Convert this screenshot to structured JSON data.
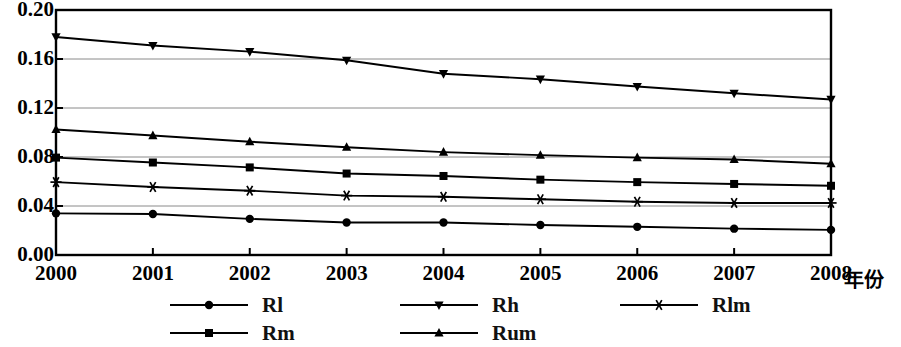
{
  "chart_data": {
    "type": "line",
    "title": "",
    "xlabel": "年份",
    "ylabel": "",
    "x": [
      2000,
      2001,
      2002,
      2003,
      2004,
      2005,
      2006,
      2007,
      2008
    ],
    "categories": [
      "2000",
      "2001",
      "2002",
      "2003",
      "2004",
      "2005",
      "2006",
      "2007",
      "2008"
    ],
    "ylim": [
      0.0,
      0.2
    ],
    "yticks": [
      0.0,
      0.04,
      0.08,
      0.12,
      0.16,
      0.2
    ],
    "ytick_labels": [
      "0.00",
      "0.04",
      "0.08",
      "0.12",
      "0.16",
      "0.20"
    ],
    "grid": "horizontal",
    "legend_position": "below",
    "series": [
      {
        "name": "Rl",
        "marker": "circle",
        "color": "#000000",
        "values": [
          0.034,
          0.0335,
          0.0295,
          0.0265,
          0.0265,
          0.0245,
          0.023,
          0.0215,
          0.0205
        ]
      },
      {
        "name": "Rh",
        "marker": "triangle-down",
        "color": "#000000",
        "values": [
          0.178,
          0.171,
          0.166,
          0.159,
          0.148,
          0.1435,
          0.1375,
          0.132,
          0.127
        ]
      },
      {
        "name": "Rlm",
        "marker": "asterisk",
        "color": "#000000",
        "values": [
          0.0595,
          0.0555,
          0.0525,
          0.0485,
          0.0475,
          0.0455,
          0.0435,
          0.0425,
          0.0425
        ]
      },
      {
        "name": "Rm",
        "marker": "square",
        "color": "#000000",
        "values": [
          0.0795,
          0.0755,
          0.0715,
          0.0665,
          0.0645,
          0.0615,
          0.0595,
          0.058,
          0.0565
        ]
      },
      {
        "name": "Rum",
        "marker": "triangle-up",
        "color": "#000000",
        "values": [
          0.1025,
          0.0975,
          0.0925,
          0.088,
          0.084,
          0.0815,
          0.0795,
          0.078,
          0.0745
        ]
      }
    ]
  },
  "legend": {
    "rows": [
      [
        {
          "label": "Rl",
          "marker": "circle"
        },
        {
          "label": "Rh",
          "marker": "triangle-down"
        },
        {
          "label": "Rlm",
          "marker": "asterisk"
        }
      ],
      [
        {
          "label": "Rm",
          "marker": "square"
        },
        {
          "label": "Rum",
          "marker": "triangle-up"
        }
      ]
    ]
  },
  "axis": {
    "x_title": "年份"
  }
}
